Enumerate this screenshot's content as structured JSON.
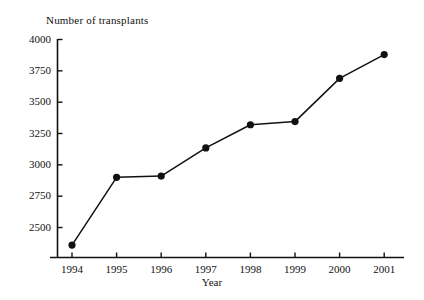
{
  "chart_data": {
    "type": "line",
    "title": "Number of transplants",
    "xlabel": "Year",
    "ylabel": "",
    "categories": [
      "1994",
      "1995",
      "1996",
      "1997",
      "1998",
      "1999",
      "2000",
      "2001"
    ],
    "x": [
      1994,
      1995,
      1996,
      1997,
      1998,
      1999,
      2000,
      2001
    ],
    "values": [
      2360,
      2900,
      2910,
      3135,
      3320,
      3345,
      3690,
      3880
    ],
    "series": [
      {
        "name": "Number of transplants",
        "values": [
          2360,
          2900,
          2910,
          3135,
          3320,
          3345,
          3690,
          3880
        ]
      }
    ],
    "ylim": [
      2290,
      4000
    ],
    "xlim": [
      1993.65,
      2001.45
    ],
    "ytick_labels": [
      "2500",
      "2750",
      "3000",
      "3250",
      "3500",
      "3750",
      "4000"
    ],
    "yticks": [
      2500,
      2750,
      3000,
      3250,
      3500,
      3750,
      4000
    ],
    "xtick_labels": [
      "1994",
      "1995",
      "1996",
      "1997",
      "1998",
      "1999",
      "2000",
      "2001"
    ],
    "grid": false,
    "legend": false,
    "legend_position": "none",
    "marker": "filled-circle",
    "line_color": "#111111",
    "marker_color": "#111111",
    "axis_color": "#111111",
    "background_color": "#ffffff"
  }
}
